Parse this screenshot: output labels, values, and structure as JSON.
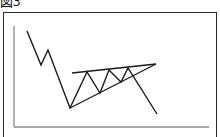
{
  "figure": {
    "title": "図3"
  },
  "colors": {
    "line": "#1a1a1a",
    "axis": "#8a8a8a",
    "frame": "#2a2a2a",
    "background": "#ffffff"
  },
  "chart_data": {
    "type": "line",
    "title": "図3",
    "xlabel": "",
    "ylabel": "",
    "grid": false,
    "series": [
      {
        "name": "price",
        "points": [
          [
            27,
            31
          ],
          [
            41,
            65
          ],
          [
            48,
            50
          ],
          [
            70,
            108
          ],
          [
            87,
            72
          ],
          [
            100,
            93
          ],
          [
            109,
            70
          ],
          [
            121,
            82
          ],
          [
            128,
            68
          ],
          [
            157,
            114
          ]
        ]
      },
      {
        "name": "upper-trendline",
        "points": [
          [
            72,
            73
          ],
          [
            156,
            64
          ]
        ]
      },
      {
        "name": "lower-trendline",
        "points": [
          [
            70,
            108
          ],
          [
            156,
            64
          ]
        ]
      }
    ],
    "axes": {
      "y_axis": [
        [
          14,
          26
        ],
        [
          14,
          127
        ]
      ],
      "x_axis": [
        [
          14,
          127
        ],
        [
          209,
          127
        ]
      ]
    }
  }
}
